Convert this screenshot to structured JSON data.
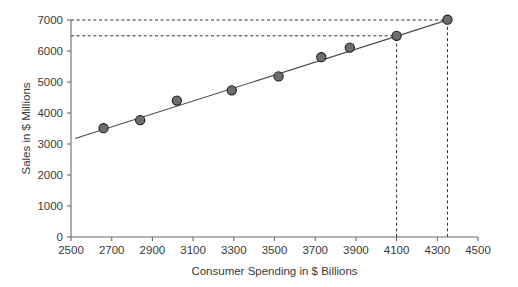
{
  "chart_data": {
    "type": "scatter",
    "title": "",
    "xlabel": "Consumer Spending in $ Billions",
    "ylabel": "Sales in $ Millions",
    "xlim": [
      2500,
      4500
    ],
    "ylim": [
      0,
      7000
    ],
    "xticks": [
      2500,
      2700,
      2900,
      3100,
      3300,
      3500,
      3700,
      3900,
      4100,
      4300,
      4500
    ],
    "yticks": [
      0,
      1000,
      2000,
      3000,
      4000,
      5000,
      6000,
      7000
    ],
    "xtick_labels": [
      "2500",
      "2700",
      "2900",
      "3100",
      "3300",
      "3500",
      "3700",
      "3900",
      "4100",
      "4300",
      "4500"
    ],
    "ytick_labels": [
      "0",
      "1000",
      "2000",
      "3000",
      "4000",
      "5000",
      "6000",
      "7000"
    ],
    "grid": false,
    "legend": null,
    "series": [
      {
        "name": "Sales vs Consumer Spending",
        "marker": "circle",
        "color": "#6e6e6e",
        "x": [
          2660,
          2840,
          3020,
          3290,
          3520,
          3730,
          3870,
          4100,
          4350
        ],
        "y": [
          3510,
          3770,
          4400,
          4730,
          5180,
          5800,
          6110,
          6490,
          7010
        ]
      }
    ],
    "trend_line": {
      "name": "least-squares regression line",
      "color": "#4a4a4a",
      "x_start": 2520,
      "y_start": 3175,
      "x_end": 4360,
      "y_end": 7020
    },
    "reference_lines": [
      {
        "orientation": "horizontal",
        "value": 7000,
        "x_from": 2500,
        "x_to": 4350,
        "style": "dashed"
      },
      {
        "orientation": "horizontal",
        "value": 6490,
        "x_from": 2500,
        "x_to": 4100,
        "style": "dashed"
      },
      {
        "orientation": "vertical",
        "value": 4100,
        "y_from": 0,
        "y_to": 6490,
        "style": "dashed"
      },
      {
        "orientation": "vertical",
        "value": 4350,
        "y_from": 0,
        "y_to": 7000,
        "style": "dashed"
      }
    ]
  }
}
